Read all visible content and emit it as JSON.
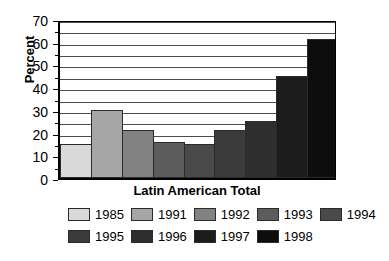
{
  "chart_data": {
    "type": "bar",
    "title": "",
    "subtitle": "",
    "xlabel": "Latin American Total",
    "ylabel": "Percent",
    "categories": [
      "Latin American Total"
    ],
    "ylim": [
      0,
      70
    ],
    "y_ticks": [
      0,
      10,
      20,
      30,
      40,
      50,
      60,
      70
    ],
    "y_tick_labels": [
      "0",
      "10",
      "20",
      "30",
      "40",
      "50",
      "60",
      "70"
    ],
    "y_gridlines": [
      5,
      10,
      15,
      20,
      25,
      30,
      35,
      40,
      45,
      50,
      55,
      60,
      65,
      70
    ],
    "grid": true,
    "legend_position": "bottom",
    "series": [
      {
        "name": "1985",
        "values": [
          15
        ],
        "color": "#d9d9d9"
      },
      {
        "name": "1991",
        "values": [
          30
        ],
        "color": "#a6a6a6"
      },
      {
        "name": "1992",
        "values": [
          21
        ],
        "color": "#828282"
      },
      {
        "name": "1993",
        "values": [
          16
        ],
        "color": "#5c5c5c"
      },
      {
        "name": "1994",
        "values": [
          15
        ],
        "color": "#4a4a4a"
      },
      {
        "name": "1995",
        "values": [
          21
        ],
        "color": "#3b3b3b"
      },
      {
        "name": "1996",
        "values": [
          25
        ],
        "color": "#2e2e2e"
      },
      {
        "name": "1997",
        "values": [
          45
        ],
        "color": "#1c1c1c"
      },
      {
        "name": "1998",
        "values": [
          61
        ],
        "color": "#0d0d0d"
      }
    ],
    "legend_rows": [
      [
        "1985",
        "1991",
        "1992",
        "1993",
        "1994"
      ],
      [
        "1995",
        "1996",
        "1997",
        "1998"
      ]
    ]
  },
  "colors": {
    "background": "#ffffff",
    "axis": "#000000",
    "gridline": "#4d4d4d",
    "bar_outline": "#2b2b2b"
  }
}
